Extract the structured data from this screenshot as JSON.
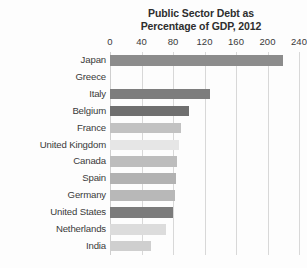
{
  "chart_data": {
    "type": "bar",
    "orientation": "horizontal",
    "title": "Public Sector Debt as Percentage of GDP, 2012",
    "title_lines": [
      "Public Sector Debt as",
      "Percentage of GDP, 2012"
    ],
    "xlabel": "",
    "ylabel": "",
    "xlim": [
      0,
      240
    ],
    "tick_labels": [
      "0",
      "40",
      "80",
      "120",
      "160",
      "200",
      "240"
    ],
    "tick_values": [
      0,
      40,
      80,
      120,
      160,
      200,
      240
    ],
    "grid": "vertical",
    "legend": "none",
    "categories": [
      "Japan",
      "Greece",
      "Italy",
      "Belgium",
      "France",
      "United Kingdom",
      "Canada",
      "Spain",
      "Germany",
      "United States",
      "Netherlands",
      "India"
    ],
    "values": [
      220,
      0,
      127,
      100,
      90,
      88,
      85,
      84,
      82,
      80,
      71,
      52
    ],
    "bar_colors": [
      "#8c8c8c",
      "#fcfcfc",
      "#7d7d7d",
      "#6f6f6f",
      "#c2c2c2",
      "#e6e6e6",
      "#bdbdbd",
      "#b2b2b2",
      "#b8b8b8",
      "#7b7b7b",
      "#dcdcdc",
      "#cfcfcf"
    ],
    "bars": [
      {
        "label": "Japan",
        "value": 220,
        "color": "#8c8c8c"
      },
      {
        "label": "Greece",
        "value": 0,
        "color": "#fcfcfc"
      },
      {
        "label": "Italy",
        "value": 127,
        "color": "#7d7d7d"
      },
      {
        "label": "Belgium",
        "value": 100,
        "color": "#6f6f6f"
      },
      {
        "label": "France",
        "value": 90,
        "color": "#c2c2c2"
      },
      {
        "label": "United Kingdom",
        "value": 88,
        "color": "#e6e6e6"
      },
      {
        "label": "Canada",
        "value": 85,
        "color": "#bdbdbd"
      },
      {
        "label": "Spain",
        "value": 84,
        "color": "#b2b2b2"
      },
      {
        "label": "Germany",
        "value": 82,
        "color": "#b8b8b8"
      },
      {
        "label": "United States",
        "value": 80,
        "color": "#7b7b7b"
      },
      {
        "label": "Netherlands",
        "value": 71,
        "color": "#dcdcdc"
      },
      {
        "label": "India",
        "value": 52,
        "color": "#cfcfcf"
      }
    ],
    "colors": {
      "background": "#fdfdfd",
      "gridline": "#d8d8d8",
      "text": "#3a3a3a",
      "title_text": "#2e2e2e"
    }
  }
}
